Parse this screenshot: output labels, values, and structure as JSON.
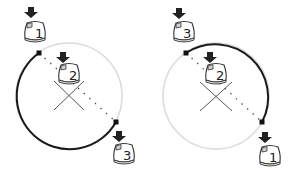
{
  "diagram": {
    "colors": {
      "arc_active": "#1a1a1a",
      "arc_inactive": "#d9d9d9",
      "chord_dots": "#555555",
      "center_x": "#444444",
      "mouse_outline": "#333333",
      "arrow": "#222222"
    },
    "panels": [
      {
        "id": "left",
        "circle": {
          "cx": 69,
          "cy": 96,
          "r": 53
        },
        "start_point": {
          "x": 39,
          "y": 53
        },
        "end_point": {
          "x": 116,
          "y": 122
        },
        "arc_direction": "counterclockwise-through-left-and-bottom",
        "clicks": [
          {
            "label": "1",
            "role": "start",
            "x": 26,
            "y": 20
          },
          {
            "label": "2",
            "role": "center",
            "x": 58,
            "y": 63
          },
          {
            "label": "3",
            "role": "end",
            "x": 113,
            "y": 143
          }
        ]
      },
      {
        "id": "right",
        "circle": {
          "cx": 216,
          "cy": 96,
          "r": 53
        },
        "start_point": {
          "x": 186,
          "y": 53
        },
        "end_point": {
          "x": 262,
          "y": 122
        },
        "arc_direction": "clockwise-through-top-and-right",
        "clicks": [
          {
            "label": "3",
            "role": "end",
            "x": 174,
            "y": 20
          },
          {
            "label": "2",
            "role": "center",
            "x": 205,
            "y": 63
          },
          {
            "label": "1",
            "role": "start",
            "x": 259,
            "y": 145
          }
        ]
      }
    ]
  }
}
